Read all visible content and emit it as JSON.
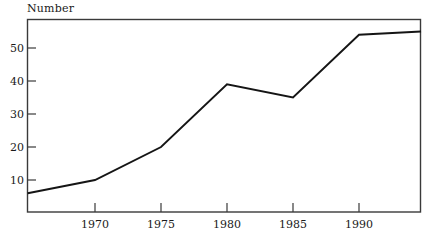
{
  "chart_data": {
    "type": "line",
    "title": "Number",
    "xlabel": "",
    "ylabel": "Number",
    "xlim": [
      1964.9,
      1994.7
    ],
    "ylim": [
      0,
      58
    ],
    "grid": false,
    "legend": null,
    "x_ticks": [
      1970,
      1975,
      1980,
      1985,
      1990
    ],
    "x_tick_labels": [
      "1970",
      "1975",
      "1980",
      "1985",
      "1990"
    ],
    "y_ticks": [
      10,
      20,
      30,
      40,
      50
    ],
    "y_tick_labels": [
      "10",
      "20",
      "30",
      "40",
      "50"
    ],
    "series": [
      {
        "name": "Number",
        "color": "#151515",
        "x": [
          1964.9,
          1970,
          1975,
          1980,
          1985,
          1990,
          1994.7
        ],
        "values": [
          6,
          10,
          20,
          39,
          35,
          54,
          55
        ]
      }
    ]
  },
  "axes": {
    "title_text": "Number",
    "frame_color": "#3a3a3a"
  }
}
